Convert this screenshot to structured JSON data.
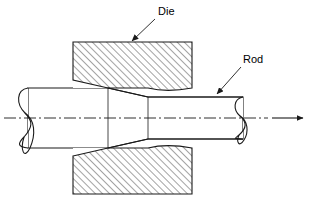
{
  "figure": {
    "background_color": "#ffffff",
    "line_color": "#1a1a1a",
    "hatch_color": "#333333",
    "width": 311,
    "height": 204
  },
  "labels": {
    "die": "Die",
    "rod": "Rod"
  },
  "annotations": {
    "die_label_position": {
      "x": 158,
      "y": 14
    },
    "rod_label_position": {
      "x": 243,
      "y": 62
    },
    "die_leader_from": {
      "x": 155,
      "y": 18
    },
    "die_leader_to": {
      "x": 131,
      "y": 42
    },
    "rod_leader_from": {
      "x": 241,
      "y": 66
    },
    "rod_leader_to": {
      "x": 216,
      "y": 95
    }
  },
  "geometry": {
    "centerline_y": 118,
    "centerline_x_start": 4,
    "centerline_x_end": 268,
    "die_left_x": 73,
    "die_right_x": 192,
    "die_upper_top_y": 42,
    "die_upper_bottom_y": 88,
    "die_lower_top_y": 148,
    "die_lower_bottom_y": 194,
    "rod_inlet_top_y": 88,
    "rod_inlet_bottom_y": 148,
    "rod_outlet_top_y": 97,
    "rod_outlet_bottom_y": 139,
    "rod_left_end_x": 20,
    "rod_right_end_x": 243,
    "taper_start_x": 108,
    "taper_end_x": 148,
    "break_symbol_left_x": 28,
    "break_symbol_right_x": 234
  },
  "arrow": {
    "name": "drawing-direction-arrow",
    "x_start": 272,
    "x_end": 305,
    "y": 118,
    "direction": "right"
  },
  "elements": {
    "die_upper_name": "die-upper-half",
    "die_lower_name": "die-lower-half",
    "rod_name": "rod-workpiece",
    "centerline_name": "axis-centerline"
  }
}
